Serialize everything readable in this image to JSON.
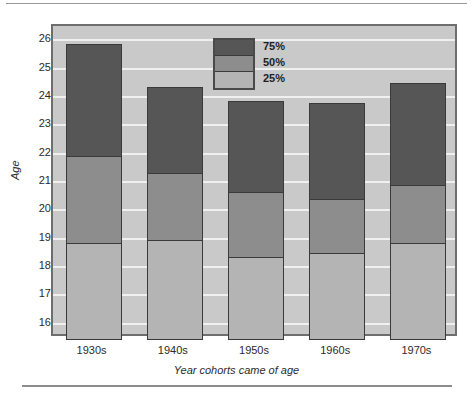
{
  "chart_data": {
    "type": "bar",
    "title": "",
    "xlabel": "Year cohorts came of age",
    "ylabel": "Age",
    "categories": [
      "1930s",
      "1940s",
      "1950s",
      "1960s",
      "1970s"
    ],
    "ylim": [
      15.5,
      26.5
    ],
    "yticks": [
      16,
      17,
      18,
      19,
      20,
      21,
      22,
      23,
      24,
      25,
      26
    ],
    "grid": true,
    "legend_position": "top-center",
    "stacked": true,
    "series": [
      {
        "name": "75%",
        "color": "#565656",
        "values": [
          25.85,
          24.35,
          23.85,
          23.8,
          24.5
        ]
      },
      {
        "name": "50%",
        "color": "#8d8d8d",
        "values": [
          21.9,
          21.3,
          20.65,
          20.4,
          20.9
        ]
      },
      {
        "name": "25%",
        "color": "#b4b4b4",
        "values": [
          18.85,
          18.95,
          18.35,
          18.5,
          18.85
        ]
      }
    ]
  },
  "legend": {
    "items": [
      {
        "label": "75%",
        "color": "#565656"
      },
      {
        "label": "50%",
        "color": "#8d8d8d"
      },
      {
        "label": "25%",
        "color": "#b4b4b4"
      }
    ]
  },
  "axes": {
    "y_title": "Age",
    "x_title": "Year cohorts came of age",
    "y_tick_labels": [
      "26",
      "25",
      "24",
      "23",
      "22",
      "21",
      "20",
      "19",
      "18",
      "17",
      "16"
    ],
    "x_tick_labels": [
      "1930s",
      "1940s",
      "1950s",
      "1960s",
      "1970s"
    ]
  },
  "colors": {
    "panel_background": "#c9c9c9",
    "panel_border": "#6e6e6e",
    "gridline": "#f0f0f0",
    "bar_outline": "#3a3a3a",
    "text": "#2b2b2b",
    "page_background": "#ffffff",
    "rule": "#9a9a9a"
  }
}
